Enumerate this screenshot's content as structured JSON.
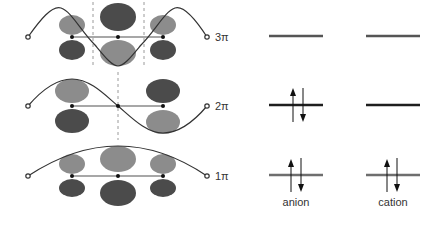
{
  "diagram": {
    "colors": {
      "dark_lobe": "#4b4b4b",
      "light_lobe": "#8c8c8c",
      "curve": "#333333",
      "bond": "#8a8a8a",
      "node_dash": "#9a9a9a",
      "level_dark": "#1e1e1e",
      "level_gray": "#6e6e6e",
      "level_3pi": "#555555",
      "text": "#333333"
    },
    "orbitals": [
      {
        "label": "3π",
        "y": 37,
        "nodes_x": [
          93,
          144
        ],
        "lobes": [
          {
            "cx": 72,
            "top": {
              "rx": 13,
              "ry": 10,
              "shade": "light"
            },
            "bottom": {
              "rx": 13,
              "ry": 10,
              "shade": "dark"
            }
          },
          {
            "cx": 118,
            "top": {
              "rx": 18,
              "ry": 14,
              "shade": "dark"
            },
            "bottom": {
              "rx": 18,
              "ry": 14,
              "shade": "light"
            }
          },
          {
            "cx": 163,
            "top": {
              "rx": 13,
              "ry": 10,
              "shade": "light"
            },
            "bottom": {
              "rx": 13,
              "ry": 10,
              "shade": "dark"
            }
          }
        ]
      },
      {
        "label": "2π",
        "y": 106,
        "nodes_x": [
          118
        ],
        "lobes": [
          {
            "cx": 72,
            "top": {
              "rx": 17,
              "ry": 12,
              "shade": "light"
            },
            "bottom": {
              "rx": 17,
              "ry": 12,
              "shade": "dark"
            }
          },
          {
            "cx": 163,
            "top": {
              "rx": 17,
              "ry": 12,
              "shade": "dark"
            },
            "bottom": {
              "rx": 17,
              "ry": 12,
              "shade": "light"
            }
          }
        ]
      },
      {
        "label": "1π",
        "y": 176,
        "nodes_x": [],
        "lobes": [
          {
            "cx": 72,
            "top": {
              "rx": 13,
              "ry": 10,
              "shade": "light"
            },
            "bottom": {
              "rx": 13,
              "ry": 10,
              "shade": "dark"
            }
          },
          {
            "cx": 118,
            "top": {
              "rx": 18,
              "ry": 13,
              "shade": "light"
            },
            "bottom": {
              "rx": 18,
              "ry": 13,
              "shade": "dark"
            }
          },
          {
            "cx": 163,
            "top": {
              "rx": 13,
              "ry": 10,
              "shade": "light"
            },
            "bottom": {
              "rx": 13,
              "ry": 10,
              "shade": "dark"
            }
          }
        ]
      }
    ],
    "energy_levels": {
      "columns": [
        {
          "label": "anion",
          "x1": 269,
          "x2": 323,
          "center": 296
        },
        {
          "label": "cation",
          "x1": 366,
          "x2": 420,
          "center": 393
        }
      ],
      "levels": [
        {
          "orbital": "3π",
          "y": 36,
          "anion_electrons": 0,
          "cation_electrons": 0
        },
        {
          "orbital": "2π",
          "y": 105,
          "anion_electrons": 2,
          "cation_electrons": 0
        },
        {
          "orbital": "1π",
          "y": 175,
          "anion_electrons": 2,
          "cation_electrons": 2
        }
      ]
    },
    "labels": {
      "orbital_3": "3π",
      "orbital_2": "2π",
      "orbital_1": "1π",
      "anion": "anion",
      "cation": "cation"
    }
  }
}
